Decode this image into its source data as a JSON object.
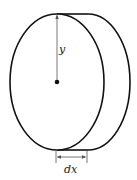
{
  "diagram": {
    "type": "disk-slice",
    "labels": {
      "radius": "y",
      "thickness": "dx"
    },
    "colors": {
      "stroke": "#111111",
      "thin_stroke": "#555555",
      "background": "#ffffff"
    }
  }
}
